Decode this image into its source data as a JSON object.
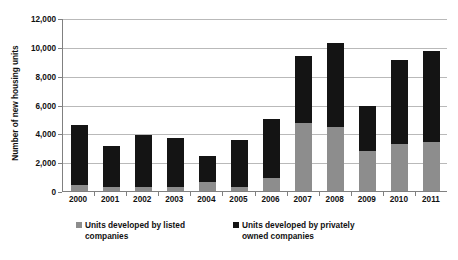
{
  "chart_data": {
    "type": "bar",
    "subtype": "stacked-vertical",
    "title": "",
    "xlabel": "",
    "ylabel": "Number of new housing units",
    "categories": [
      "2000",
      "2001",
      "2002",
      "2003",
      "2004",
      "2005",
      "2006",
      "2007",
      "2008",
      "2009",
      "2010",
      "2011"
    ],
    "series": [
      {
        "name": "Units developed by listed companies",
        "color": "#8d8d8d",
        "values": [
          420,
          300,
          260,
          300,
          600,
          300,
          900,
          4700,
          4450,
          2800,
          3250,
          3400
        ]
      },
      {
        "name": "Units developed by privately owned companies",
        "color": "#141414",
        "values": [
          4180,
          2800,
          3640,
          3400,
          1850,
          3230,
          4100,
          4700,
          5800,
          3100,
          5850,
          6300
        ]
      }
    ],
    "totals": [
      4600,
      3100,
      3900,
      3700,
      2450,
      3530,
      5000,
      9400,
      10250,
      5900,
      9100,
      9700
    ],
    "ylim": [
      0,
      12000
    ],
    "yticks": [
      0,
      2000,
      4000,
      6000,
      8000,
      10000,
      12000
    ],
    "ytick_labels": [
      "0",
      "2,000",
      "4,000",
      "6,000",
      "8,000",
      "10,000",
      "12,000"
    ],
    "grid": true,
    "legend_position": "bottom"
  },
  "legend": {
    "entries": [
      {
        "label": "Units developed by listed companies",
        "swatch": "listed"
      },
      {
        "label": "Units developed by privately owned companies",
        "swatch": "private"
      }
    ]
  }
}
